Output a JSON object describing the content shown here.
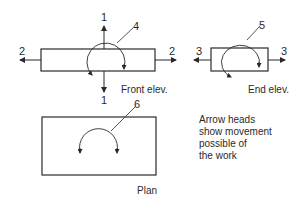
{
  "views": {
    "front": {
      "caption": "Front elev.",
      "vertical_arrow_label_top": "1",
      "vertical_arrow_label_bottom": "1",
      "horizontal_arrow_label_left": "2",
      "horizontal_arrow_label_right": "2",
      "rotation_label": "4"
    },
    "end": {
      "caption": "End elev.",
      "horizontal_arrow_label_left": "3",
      "horizontal_arrow_label_right": "3",
      "rotation_label": "5"
    },
    "plan": {
      "caption": "Plan",
      "rotation_label": "6"
    }
  },
  "note": {
    "line1": "Arrow heads",
    "line2": "show movement",
    "line3": "possible of",
    "line4": "the work"
  },
  "colors": {
    "stroke": "#2a2a2a",
    "background": "#ffffff"
  }
}
